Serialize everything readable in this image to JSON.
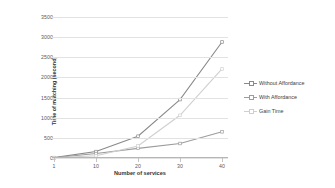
{
  "chart_data": {
    "type": "line",
    "title": "",
    "xlabel": "Number of services",
    "ylabel": "Time of matching (second)",
    "categories": [
      "1",
      "10",
      "20",
      "30",
      "40"
    ],
    "x": [
      1,
      10,
      20,
      30,
      40
    ],
    "ylim": [
      0,
      3500
    ],
    "yticks": [
      "0",
      "500",
      "1000",
      "1500",
      "2000",
      "2500",
      "3000",
      "3500"
    ],
    "ytick_values": [
      0,
      500,
      1000,
      1500,
      2000,
      2500,
      3000,
      3500
    ],
    "grid": true,
    "legend_position": "right",
    "series": [
      {
        "name": "Without Affordance",
        "values": [
          10,
          160,
          540,
          1450,
          2880
        ],
        "color": "#8a8a8a",
        "marker": "square"
      },
      {
        "name": "With Affordance",
        "values": [
          5,
          110,
          240,
          360,
          650
        ],
        "color": "#9c9c9c",
        "marker": "square"
      },
      {
        "name": "Gain Time",
        "values": [
          5,
          55,
          300,
          1060,
          2210
        ],
        "color": "#cfcfcf",
        "marker": "square"
      }
    ]
  },
  "colors": {
    "gridline": "#e2e2e2",
    "axis": "#b6b6b6",
    "text": "#595959",
    "title_text": "#333333"
  }
}
